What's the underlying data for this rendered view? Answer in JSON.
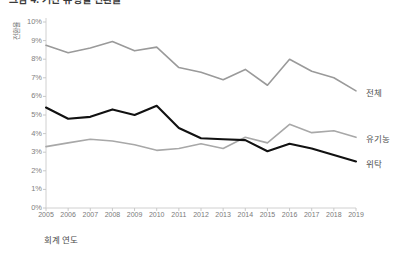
{
  "chart_data": {
    "type": "line",
    "title": "그림 4. 기관 유형별 전환율",
    "xlabel": "회계 연도",
    "ylabel": "전환율",
    "categories": [
      "2005",
      "2006",
      "2007",
      "2008",
      "2009",
      "2010",
      "2011",
      "2012",
      "2013",
      "2014",
      "2015",
      "2016",
      "2017",
      "2018",
      "2019"
    ],
    "x": [
      2005,
      2006,
      2007,
      2008,
      2009,
      2010,
      2011,
      2012,
      2013,
      2014,
      2015,
      2016,
      2017,
      2018,
      2019
    ],
    "ylim": [
      0,
      10
    ],
    "ytick_labels": [
      "0%",
      "1%",
      "2%",
      "3%",
      "4%",
      "5%",
      "6%",
      "7%",
      "8%",
      "9%",
      "10%"
    ],
    "ytick_values": [
      0,
      1,
      2,
      3,
      4,
      5,
      6,
      7,
      8,
      9,
      10
    ],
    "y_unit": "%",
    "grid": false,
    "legend": "end-of-line labels (right side)",
    "series": [
      {
        "name": "전체",
        "color": "#9a9a9a",
        "width": 1.6,
        "values": [
          8.75,
          8.35,
          8.6,
          8.95,
          8.45,
          8.65,
          7.55,
          7.3,
          6.9,
          7.45,
          6.6,
          8.0,
          7.35,
          7.0,
          6.3
        ]
      },
      {
        "name": "유기농",
        "color": "#a8a8a8",
        "width": 1.6,
        "values": [
          3.3,
          3.5,
          3.7,
          3.6,
          3.4,
          3.1,
          3.2,
          3.45,
          3.2,
          3.8,
          3.5,
          4.5,
          4.05,
          4.15,
          3.8
        ]
      },
      {
        "name": "위탁",
        "color": "#111111",
        "width": 2.1,
        "values": [
          5.4,
          4.8,
          4.9,
          5.3,
          5.0,
          5.5,
          4.3,
          3.75,
          3.7,
          3.65,
          3.05,
          3.45,
          3.2,
          2.85,
          2.5
        ]
      }
    ]
  },
  "axis": {
    "axis_color": "#d0d0d0",
    "tick_color": "#c8c8c8",
    "label_color": "#808080"
  }
}
